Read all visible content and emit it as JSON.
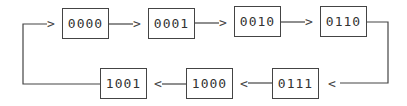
{
  "diagram": {
    "type": "state-sequence",
    "colors": {
      "line": "#444444",
      "text": "#333333",
      "background": "#ffffff"
    },
    "states": [
      {
        "label": "0000",
        "x": 62,
        "y": 8
      },
      {
        "label": "0001",
        "x": 148,
        "y": 8
      },
      {
        "label": "0010",
        "x": 234,
        "y": 6
      },
      {
        "label": "0110",
        "x": 320,
        "y": 6
      },
      {
        "label": "0111",
        "x": 272,
        "y": 68
      },
      {
        "label": "1000",
        "x": 186,
        "y": 68
      },
      {
        "label": "1001",
        "x": 100,
        "y": 68
      }
    ],
    "arrowheads": {
      "right": ">",
      "left": "<"
    },
    "sequence": [
      "0000",
      "0001",
      "0010",
      "0110",
      "0111",
      "1000",
      "1001",
      "0000"
    ]
  }
}
